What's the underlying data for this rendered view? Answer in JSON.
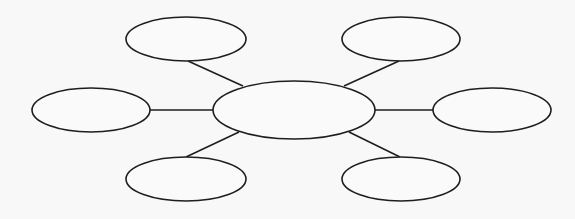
{
  "diagram": {
    "type": "bubble-map",
    "canvas": {
      "width": 575,
      "height": 219,
      "background": "#f8f8f8"
    },
    "stroke_color": "#1e1e1e",
    "center": {
      "id": "center",
      "label": "",
      "cx": 294,
      "cy": 110,
      "rx": 81,
      "ry": 29
    },
    "nodes": [
      {
        "id": "top-left",
        "label": "",
        "cx": 186,
        "cy": 39,
        "rx": 60,
        "ry": 22
      },
      {
        "id": "top-right",
        "label": "",
        "cx": 401,
        "cy": 39,
        "rx": 59,
        "ry": 22
      },
      {
        "id": "left",
        "label": "",
        "cx": 91,
        "cy": 110,
        "rx": 59,
        "ry": 22
      },
      {
        "id": "right",
        "label": "",
        "cx": 492,
        "cy": 110,
        "rx": 59,
        "ry": 22
      },
      {
        "id": "bottom-left",
        "label": "",
        "cx": 186,
        "cy": 179,
        "rx": 60,
        "ry": 22
      },
      {
        "id": "bottom-right",
        "label": "",
        "cx": 401,
        "cy": 179,
        "rx": 59,
        "ry": 22
      }
    ],
    "connectors": [
      {
        "from": "center",
        "to": "top-left",
        "x1": 243,
        "y1": 86,
        "x2": 188,
        "y2": 61
      },
      {
        "from": "center",
        "to": "top-right",
        "x1": 344,
        "y1": 86,
        "x2": 399,
        "y2": 61
      },
      {
        "from": "center",
        "to": "left",
        "x1": 213,
        "y1": 110,
        "x2": 150,
        "y2": 110
      },
      {
        "from": "center",
        "to": "right",
        "x1": 375,
        "y1": 110,
        "x2": 433,
        "y2": 110
      },
      {
        "from": "center",
        "to": "bottom-left",
        "x1": 239,
        "y1": 132,
        "x2": 186,
        "y2": 157
      },
      {
        "from": "center",
        "to": "bottom-right",
        "x1": 349,
        "y1": 132,
        "x2": 400,
        "y2": 157
      }
    ]
  }
}
